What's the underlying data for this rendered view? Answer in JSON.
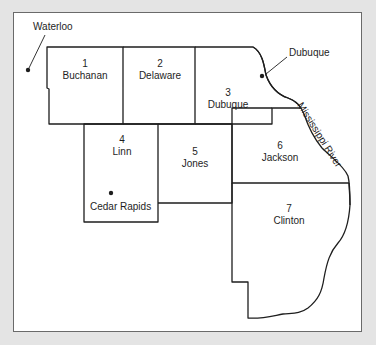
{
  "map": {
    "background_color": "#e4e4e4",
    "frame_color": "#ffffff",
    "line_color": "#1e1e1e",
    "counties": [
      {
        "number": "1",
        "name": "Buchanan",
        "x": 85,
        "y": 58
      },
      {
        "number": "2",
        "name": "Delaware",
        "x": 160,
        "y": 58
      },
      {
        "number": "3",
        "name": "Dubuque",
        "x": 228,
        "y": 88
      },
      {
        "number": "4",
        "name": "Linn",
        "x": 122,
        "y": 135
      },
      {
        "number": "5",
        "name": "Jones",
        "x": 195,
        "y": 148
      },
      {
        "number": "6",
        "name": "Jackson",
        "x": 288,
        "y": 140
      },
      {
        "number": "7",
        "name": "Clinton",
        "x": 288,
        "y": 206
      }
    ],
    "cities": [
      {
        "name": "Waterloo",
        "dot_x": 28,
        "dot_y": 70
      },
      {
        "name": "Dubuque",
        "dot_x": 263,
        "dot_y": 76
      },
      {
        "name": "Cedar Rapids",
        "dot_x": 111,
        "dot_y": 193
      }
    ],
    "river": {
      "name": "Mississippi River"
    }
  }
}
